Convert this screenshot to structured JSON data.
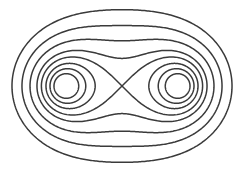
{
  "diagram": {
    "type": "contour-lines",
    "center": [
      122,
      86
    ],
    "focus_offset": 57,
    "y_scale": 1.02,
    "stroke_color": "#3a3a3a",
    "background_color": "#ffffff",
    "curves": {
      "inner_loops_per_lobe": [
        37.1,
        44.0,
        50.3
      ],
      "separatrix": 57,
      "outer": [
        63.1,
        72.2,
        82.2,
        94.1
      ]
    },
    "saddle_point": [
      122,
      86
    ],
    "lobe_centers": [
      [
        75,
        86
      ],
      [
        170,
        86
      ]
    ]
  }
}
